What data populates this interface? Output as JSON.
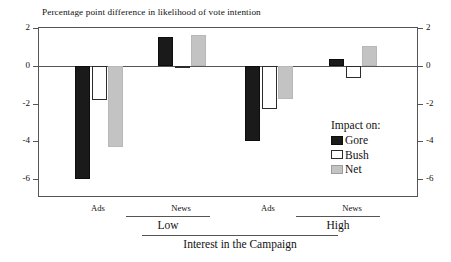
{
  "chart_data": {
    "type": "bar",
    "title": "Percentage point difference in likelihood of vote intention",
    "xlabel": "Interest in the Campaign",
    "ylabel": "",
    "ylim": [
      -7,
      2
    ],
    "yticks": [
      2,
      0,
      -2,
      -4,
      -6
    ],
    "ytick_labels": [
      "2",
      "0",
      "-2",
      "-4",
      "-6"
    ],
    "grid": false,
    "legend_position": "inside-right",
    "legend_title": "Impact on:",
    "categories": [
      "Ads",
      "News",
      "Ads",
      "News"
    ],
    "group_labels": [
      "Low",
      "High"
    ],
    "group_spans": [
      {
        "label": "Low",
        "categories": [
          "Ads",
          "News"
        ]
      },
      {
        "label": "High",
        "categories": [
          "Ads",
          "News"
        ]
      }
    ],
    "series": [
      {
        "name": "Gore",
        "color": "#1a1a1a",
        "values": [
          -6.0,
          1.55,
          -4.0,
          0.35
        ]
      },
      {
        "name": "Bush",
        "color": "#ffffff",
        "values": [
          -1.8,
          -0.1,
          -2.3,
          -0.65
        ]
      },
      {
        "name": "Net",
        "color": "#c3c3c3",
        "values": [
          -4.3,
          1.65,
          -1.75,
          1.05
        ]
      }
    ]
  },
  "chart": {
    "title": "Percentage point difference in likelihood of vote intention",
    "axis": {
      "left_ticks": [
        "2",
        "0",
        "-2",
        "-4",
        "-6"
      ],
      "right_ticks": [
        "2",
        "0",
        "-2",
        "-4",
        "-6"
      ]
    },
    "legend": {
      "title": "Impact on:",
      "items": [
        {
          "label": "Gore"
        },
        {
          "label": "Bush"
        },
        {
          "label": "Net"
        }
      ]
    },
    "xaxis": {
      "leaf_labels": [
        "Ads",
        "News",
        "Ads",
        "News"
      ],
      "mid_labels": [
        "Low",
        "High"
      ],
      "root_label": "Interest in the Campaign"
    }
  }
}
